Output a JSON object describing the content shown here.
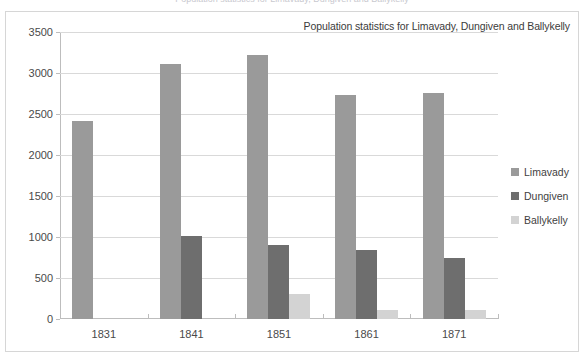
{
  "top_clip_text": "Population statistics for Limavady, Dungiven and Ballykelly",
  "legend": {
    "items": [
      {
        "label": "Limavady",
        "color": "#9a9a9a"
      },
      {
        "label": "Dungiven",
        "color": "#6e6e6e"
      },
      {
        "label": "Ballykelly",
        "color": "#d3d3d3"
      }
    ]
  },
  "chart_data": {
    "type": "bar",
    "title": "Population statistics for Limavady, Dungiven and Ballykelly",
    "xlabel": "",
    "ylabel": "",
    "categories": [
      "1831",
      "1841",
      "1851",
      "1861",
      "1871"
    ],
    "series": [
      {
        "name": "Limavady",
        "color": "#9a9a9a",
        "values": [
          2420,
          3110,
          3215,
          2730,
          2760
        ]
      },
      {
        "name": "Dungiven",
        "color": "#6e6e6e",
        "values": [
          0,
          1010,
          905,
          840,
          750
        ]
      },
      {
        "name": "Ballykelly",
        "color": "#d3d3d3",
        "values": [
          0,
          0,
          310,
          110,
          105
        ]
      }
    ],
    "ylim": [
      0,
      3500
    ],
    "yticks": [
      0,
      500,
      1000,
      1500,
      2000,
      2500,
      3000,
      3500
    ],
    "ytick_labels": [
      "0",
      "500",
      "1000",
      "1500",
      "2000",
      "2500",
      "3000",
      "3500"
    ],
    "grid": true,
    "legend_position": "right"
  }
}
